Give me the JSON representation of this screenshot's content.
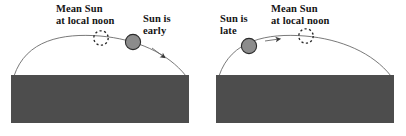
{
  "figure": {
    "background_color": "#ffffff",
    "ground_color": "#4d4d4d",
    "arc_color": "#5a5a5a",
    "sun_fill_color": "#8c8c8c",
    "sun_stroke_color": "#2b2b2b",
    "dashed_circle_color": "#2b2b2b",
    "text_color": "#141414"
  },
  "panels": [
    {
      "id": "panel-left",
      "name": "sun-early-panel",
      "mean_sun_label": {
        "line1": "Mean Sun",
        "line2": "at local noon"
      },
      "sun_label": {
        "line1": "Sun is",
        "line2": "early"
      },
      "mean_sun_marker": "dashed-circle",
      "sun_marker": "filled-circle",
      "arrow_direction": "descending-right",
      "sun_position_relative_to_mean": "ahead"
    },
    {
      "id": "panel-right",
      "name": "sun-late-panel",
      "mean_sun_label": {
        "line1": "Mean Sun",
        "line2": "at local noon"
      },
      "sun_label": {
        "line1": "Sun is",
        "line2": "late"
      },
      "mean_sun_marker": "dashed-circle",
      "sun_marker": "filled-circle",
      "arrow_direction": "ascending-right",
      "sun_position_relative_to_mean": "behind"
    }
  ]
}
